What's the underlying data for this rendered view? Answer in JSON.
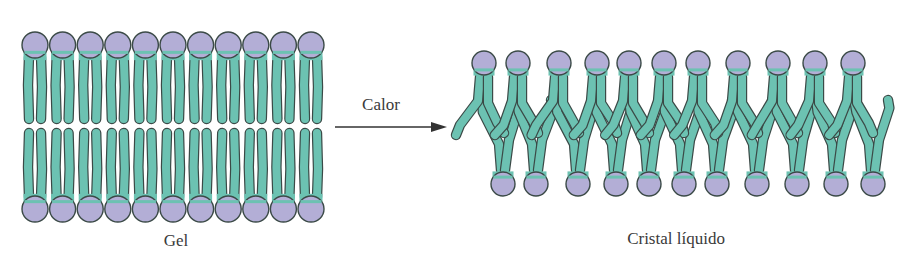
{
  "figure": {
    "type": "lipid-bilayer-phase-transition",
    "colors": {
      "head_fill": "#b3aed6",
      "tail_fill": "#6cc2b2",
      "outline": "#3b4a47",
      "arrow": "#333333",
      "text": "#3a3a3a",
      "background": "#ffffff"
    },
    "gel": {
      "label": "Gel",
      "lipids_per_leaflet": 11,
      "top_head_y": 45,
      "bottom_head_y": 209,
      "start_x": 35,
      "spacing": 27.6,
      "head_radius": 13
    },
    "transition": {
      "label": "Calor",
      "arrow_from_x": 335,
      "arrow_to_x": 447,
      "arrow_y": 127
    },
    "liquid_crystal": {
      "label": "Cristal líquido",
      "lipids_per_leaflet": 11,
      "top_heads_x": [
        484,
        518,
        559,
        597,
        629,
        664,
        698,
        738,
        778,
        815,
        853
      ],
      "top_head_y": 63,
      "bottom_heads_x": [
        503,
        536,
        578,
        616,
        649,
        684,
        717,
        757,
        797,
        836,
        873
      ],
      "bottom_head_y": 184,
      "head_radius": 12
    }
  }
}
